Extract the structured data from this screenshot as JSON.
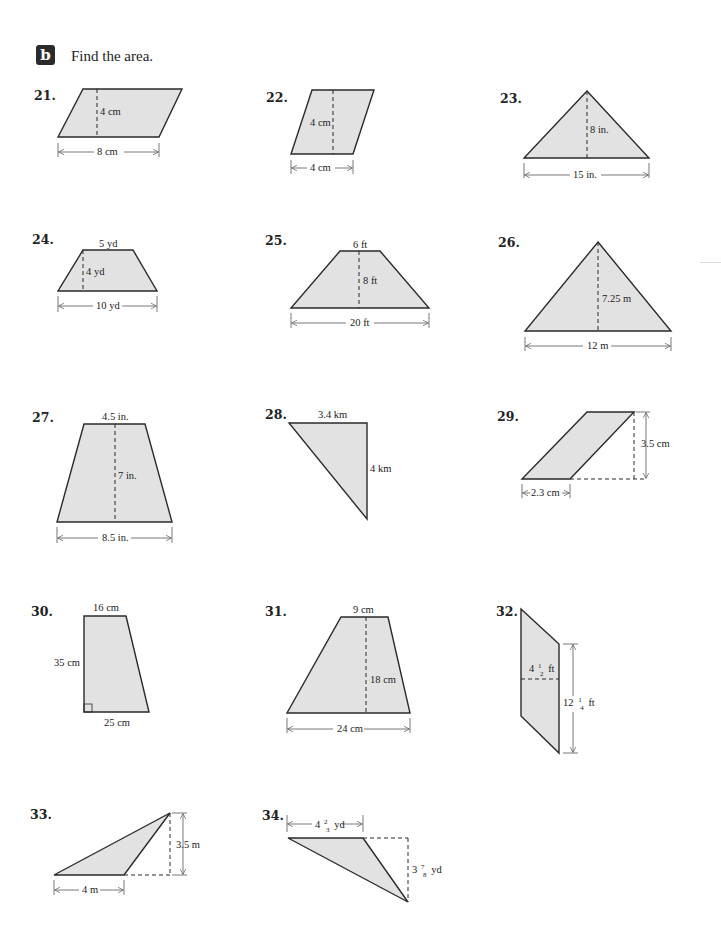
{
  "header": {
    "section_badge": "b",
    "instruction": "Find the area."
  },
  "problems": [
    {
      "number": "21.",
      "shape": "parallelogram",
      "height": "4 cm",
      "base": "8 cm"
    },
    {
      "number": "22.",
      "shape": "parallelogram",
      "height": "4 cm",
      "base": "4 cm"
    },
    {
      "number": "23.",
      "shape": "triangle",
      "height": "8 in.",
      "base": "15 in."
    },
    {
      "number": "24.",
      "shape": "trapezoid",
      "top": "5 yd",
      "height": "4 yd",
      "base": "10 yd"
    },
    {
      "number": "25.",
      "shape": "trapezoid",
      "top": "6 ft",
      "height": "8 ft",
      "base": "20 ft"
    },
    {
      "number": "26.",
      "shape": "triangle",
      "height": "7.25 m",
      "base": "12 m"
    },
    {
      "number": "27.",
      "shape": "trapezoid",
      "top": "4.5 in.",
      "height": "7 in.",
      "base": "8.5 in."
    },
    {
      "number": "28.",
      "shape": "right-triangle",
      "top": "3.4 km",
      "side": "4 km"
    },
    {
      "number": "29.",
      "shape": "parallelogram",
      "height": "3.5 cm",
      "base": "2.3 cm"
    },
    {
      "number": "30.",
      "shape": "right-trapezoid",
      "top": "16 cm",
      "side": "35 cm",
      "base": "25 cm"
    },
    {
      "number": "31.",
      "shape": "trapezoid",
      "top": "9 cm",
      "height": "18 cm",
      "base": "24 cm"
    },
    {
      "number": "32.",
      "shape": "parallelogram",
      "width_whole": "4",
      "width_num": "1",
      "width_den": "2",
      "width_unit": "ft",
      "height_whole": "12",
      "height_num": "1",
      "height_den": "4",
      "height_unit": "ft"
    },
    {
      "number": "33.",
      "shape": "obtuse-triangle",
      "height": "3.5 m",
      "base": "4 m"
    },
    {
      "number": "34.",
      "shape": "obtuse-triangle",
      "base_whole": "4",
      "base_num": "2",
      "base_den": "3",
      "base_unit": "yd",
      "height_whole": "3",
      "height_num": "7",
      "height_den": "8",
      "height_unit": "yd"
    }
  ]
}
